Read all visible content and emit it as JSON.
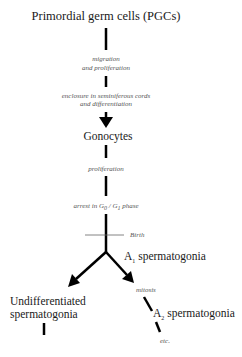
{
  "diagram": {
    "type": "flowchart",
    "title": "Primordial germ cells (PGCs)",
    "nodes": {
      "pgcs": "Primordial germ cells (PGCs)",
      "gonocytes": "Gonocytes",
      "a1_prefix": "A",
      "a1_sub": "1",
      "a1_suffix": " spermatogonia",
      "undiff_line1": "Undifferentiated",
      "undiff_line2": "spermatogonia",
      "a2_prefix": "A",
      "a2_sub": "2",
      "a2_suffix": " spermatogonia"
    },
    "annotations": {
      "migration_line1": "migration",
      "migration_line2": "and proliferation",
      "enclosure_line1": "enclosure in seminiferous cords",
      "enclosure_line2": "and differentiation",
      "proliferation": "proliferation",
      "arrest_prefix": "arrest in G",
      "arrest_sub0": "0",
      "arrest_mid": " / G",
      "arrest_sub1": "1",
      "arrest_suffix": " phase",
      "birth": "Birth",
      "mitosis": "mitosis",
      "etc": "etc."
    },
    "colors": {
      "stroke": "#000000",
      "text": "#1a1a1a",
      "note_text": "#555555",
      "birth_line": "#666666"
    }
  }
}
